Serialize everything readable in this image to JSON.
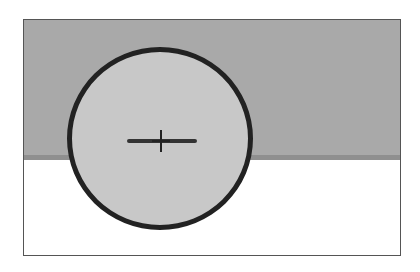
{
  "illustration": {
    "description": "Brush cursor circle with crosshair over a gray and white canvas",
    "colors": {
      "upper_region": "#a9a9a9",
      "upper_region_edge": "#8f8f8f",
      "lower_region": "#ffffff",
      "cursor_fill": "#c8c8c8",
      "cursor_outline": "#222222",
      "frame_border": "#555555"
    },
    "cursor": {
      "shape": "circle",
      "icon": "crosshair-icon"
    }
  }
}
